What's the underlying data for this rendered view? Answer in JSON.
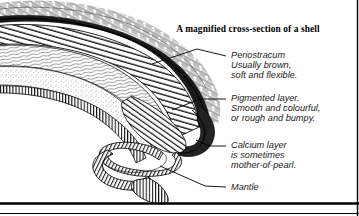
{
  "figure": {
    "title": "A magnified cross-section of a shell",
    "background_color": "#ffffff",
    "ink_color": "#000000",
    "width": 359,
    "height": 216
  },
  "labels": [
    {
      "id": "periostracum",
      "name": "Periostracum",
      "lines": [
        "Periostracum",
        "Usually brown,",
        "soft and flexible."
      ],
      "x": 231,
      "y": 58
    },
    {
      "id": "pigmented-layer",
      "name": "Pigmented layer",
      "lines": [
        "Pigmented layer.",
        "Smooth and colourful,",
        "or rough and bumpy."
      ],
      "x": 231,
      "y": 101
    },
    {
      "id": "calcium-layer",
      "name": "Calcium layer",
      "lines": [
        "Calcium layer",
        "is  sometimes",
        "mother-of-pearl."
      ],
      "x": 231,
      "y": 148
    },
    {
      "id": "mantle",
      "name": "Mantle",
      "lines": [
        "Mantle"
      ],
      "x": 231,
      "y": 189
    }
  ],
  "diagram": {
    "layers": [
      "periostracum",
      "pigmented layer",
      "calcium layer",
      "mantle"
    ],
    "baseline_label": "ground-rule"
  }
}
